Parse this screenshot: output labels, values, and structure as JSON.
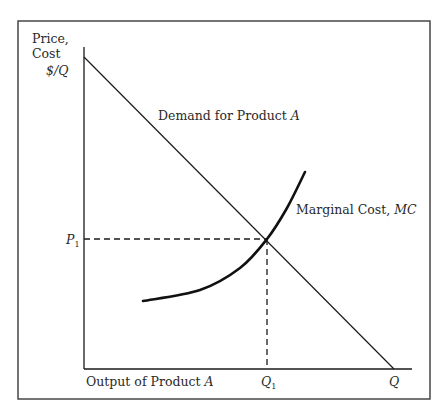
{
  "chart_data": {
    "type": "line",
    "title": "",
    "ylabel": "Price, Cost",
    "ylabel_line1": "Price,",
    "ylabel_line2": "Cost",
    "y_unit": "$/Q",
    "xlabel": "Output of Product A",
    "xlabel_text": "Output of Product ",
    "xlabel_italic": "A",
    "grid": false,
    "legend": "none",
    "series": [
      {
        "name": "Demand for Product A",
        "label_text": "Demand for Product ",
        "label_italic": "A",
        "shape": "straight downward-sloping line",
        "points_px": [
          [
            84,
            57
          ],
          [
            394,
            369
          ]
        ]
      },
      {
        "name": "Marginal Cost, MC",
        "label_text": "Marginal Cost, ",
        "label_italic": "MC",
        "shape": "convex upward-sloping curve",
        "points_px": [
          [
            143,
            301
          ],
          [
            200,
            290
          ],
          [
            240,
            268
          ],
          [
            267,
            239
          ],
          [
            287,
            208
          ],
          [
            305,
            172
          ]
        ]
      }
    ],
    "annotations": {
      "p1": {
        "label": "P",
        "subscript": "1",
        "y_px": 239
      },
      "q1": {
        "label": "Q",
        "subscript": "1",
        "x_px": 267
      },
      "q_intercept": {
        "label": "Q",
        "x_px": 394
      },
      "intersection_px": [
        267,
        239
      ]
    },
    "axes_px": {
      "origin": [
        84,
        369
      ],
      "y_top": 47,
      "x_right": 412
    },
    "frame_px": {
      "x": 18,
      "y": 21,
      "w": 412,
      "h": 378
    }
  }
}
